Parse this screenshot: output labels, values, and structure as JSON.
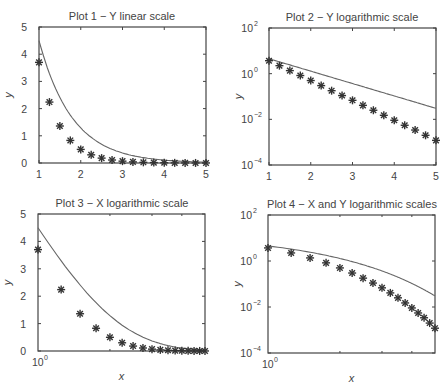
{
  "chart_data": [
    {
      "type": "line",
      "title": "Plot 1 − Y linear scale",
      "xlabel": "",
      "ylabel": "y",
      "xscale": "linear",
      "yscale": "linear",
      "xlim": [
        1,
        5
      ],
      "ylim": [
        0,
        5
      ],
      "xticks": [
        "1",
        "2",
        "3",
        "4",
        "5"
      ],
      "yticks": [
        "0",
        "1",
        "2",
        "3",
        "4",
        "5"
      ],
      "grid": false,
      "series": [
        {
          "name": "line",
          "style": "solid",
          "x": [
            1,
            1.25,
            1.5,
            1.75,
            2,
            2.25,
            2.5,
            2.75,
            3,
            3.25,
            3.5,
            3.75,
            4,
            4.25,
            4.5,
            4.75,
            5
          ],
          "values": [
            4.5,
            3.29,
            2.41,
            1.76,
            1.29,
            0.94,
            0.69,
            0.5,
            0.37,
            0.27,
            0.2,
            0.14,
            0.11,
            0.08,
            0.06,
            0.04,
            0.03
          ]
        },
        {
          "name": "markers",
          "style": "asterisk",
          "x": [
            1,
            1.25,
            1.5,
            1.75,
            2,
            2.25,
            2.5,
            2.75,
            3,
            3.25,
            3.5,
            3.75,
            4,
            4.25,
            4.5,
            4.75,
            5
          ],
          "values": [
            3.7,
            2.24,
            1.36,
            0.83,
            0.5,
            0.3,
            0.18,
            0.11,
            0.068,
            0.041,
            0.025,
            0.015,
            0.0091,
            0.0055,
            0.0034,
            0.002,
            0.0012
          ]
        }
      ]
    },
    {
      "type": "line",
      "title": "Plot 2 − Y logarithmic scale",
      "xlabel": "",
      "ylabel": "y",
      "xscale": "linear",
      "yscale": "log",
      "xlim": [
        1,
        5
      ],
      "ylim": [
        0.0001,
        100
      ],
      "xticks": [
        "1",
        "2",
        "3",
        "4",
        "5"
      ],
      "yticks": [
        "10^-4",
        "10^-2",
        "10^0",
        "10^2"
      ],
      "grid": false,
      "series": "same as Plot 1"
    },
    {
      "type": "line",
      "title": "Plot 3 − X logarithmic scale",
      "xlabel": "x",
      "ylabel": "y",
      "xscale": "log",
      "yscale": "linear",
      "xlim": [
        1,
        5
      ],
      "ylim": [
        0,
        5
      ],
      "xticks": [
        "10^0"
      ],
      "yticks": [
        "0",
        "1",
        "2",
        "3",
        "4",
        "5"
      ],
      "grid": false,
      "series": "same as Plot 1"
    },
    {
      "type": "line",
      "title": "Plot 4 − X and Y logarithmic scales",
      "xlabel": "x",
      "ylabel": "y",
      "xscale": "log",
      "yscale": "log",
      "xlim": [
        1,
        5
      ],
      "ylim": [
        0.0001,
        100
      ],
      "xticks": [
        "10^0"
      ],
      "yticks": [
        "10^-4",
        "10^-2",
        "10^0",
        "10^2"
      ],
      "grid": false,
      "series": "same as Plot 1"
    }
  ],
  "plots": [
    {
      "title": "Plot 1 − Y linear scale",
      "ylabel": "y",
      "xlabel": ""
    },
    {
      "title": "Plot 2 − Y logarithmic scale",
      "ylabel": "y",
      "xlabel": ""
    },
    {
      "title": "Plot 3 − X logarithmic scale",
      "ylabel": "y",
      "xlabel": "x"
    },
    {
      "title": "Plot 4 − X and Y logarithmic scales",
      "ylabel": "y",
      "xlabel": "x"
    }
  ],
  "colors": {
    "axis": "#444444",
    "line": "#666666",
    "marker": "#333333"
  }
}
